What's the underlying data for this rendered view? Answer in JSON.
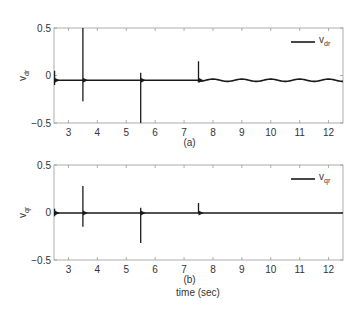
{
  "chart_data": [
    {
      "type": "line",
      "panel": "(a)",
      "title": "",
      "xlabel": "",
      "ylabel": "v_dr",
      "ylabel_main": "v",
      "ylabel_sub": "dr",
      "caption": "(a)",
      "legend": [
        {
          "label": "v_dr",
          "main": "v",
          "sub": "dr",
          "position": "upper right"
        }
      ],
      "xlim": [
        2.5,
        12.5
      ],
      "ylim": [
        -0.5,
        0.5
      ],
      "xticks": [
        3,
        4,
        5,
        6,
        7,
        8,
        9,
        10,
        11,
        12
      ],
      "yticks": [
        -0.5,
        0,
        0.5
      ],
      "ytick_labels": [
        "−0.5",
        "0",
        "0.5"
      ],
      "grid": false,
      "series": [
        {
          "name": "v_dr",
          "color": "#1a1a1a",
          "baseline_segments": [
            {
              "t_start": 2.5,
              "t_end": 7.5,
              "value": -0.05
            },
            {
              "t_start": 7.5,
              "t_end": 12.5,
              "value": -0.05,
              "oscillation_amplitude": 0.012,
              "oscillation_period": 1.0
            }
          ],
          "spikes": [
            {
              "t": 2.52,
              "max": 0.05,
              "min": -0.1
            },
            {
              "t": 3.5,
              "max": 0.5,
              "min": -0.27
            },
            {
              "t": 5.5,
              "max": 0.03,
              "min": -0.5
            },
            {
              "t": 7.5,
              "max": 0.15,
              "min": -0.06
            }
          ]
        }
      ]
    },
    {
      "type": "line",
      "panel": "(b)",
      "title": "",
      "xlabel": "time (sec)",
      "ylabel": "v_qr",
      "ylabel_main": "v",
      "ylabel_sub": "qr",
      "caption": "(b)",
      "legend": [
        {
          "label": "v_qr",
          "main": "v",
          "sub": "qr",
          "position": "upper right"
        }
      ],
      "xlim": [
        2.5,
        12.5
      ],
      "ylim": [
        -0.5,
        0.5
      ],
      "xticks": [
        3,
        4,
        5,
        6,
        7,
        8,
        9,
        10,
        11,
        12
      ],
      "yticks": [
        -0.5,
        0,
        0.5
      ],
      "ytick_labels": [
        "−0.5",
        "0",
        "0.5"
      ],
      "grid": false,
      "series": [
        {
          "name": "v_qr",
          "color": "#1a1a1a",
          "baseline_segments": [
            {
              "t_start": 2.5,
              "t_end": 12.5,
              "value": -0.005
            }
          ],
          "spikes": [
            {
              "t": 2.52,
              "max": 0.04,
              "min": -0.04
            },
            {
              "t": 3.5,
              "max": 0.28,
              "min": -0.15
            },
            {
              "t": 5.5,
              "max": 0.05,
              "min": -0.32
            },
            {
              "t": 7.5,
              "max": 0.1,
              "min": -0.01
            }
          ]
        }
      ]
    }
  ]
}
